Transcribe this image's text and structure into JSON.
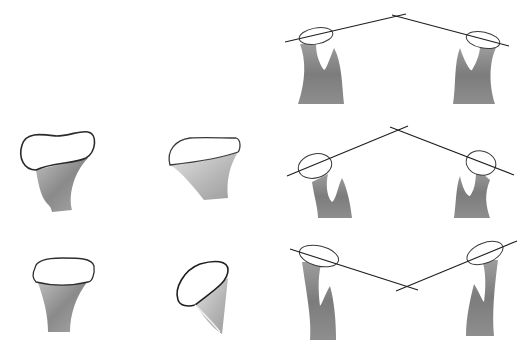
{
  "figure": {
    "background": "#ffffff",
    "colors": {
      "outline": "#2a2a2a",
      "shaft_dark": "#6e6e6e",
      "shaft_mid": "#9a9a9a",
      "shaft_light": "#c9c9c9",
      "head_fill": "#ffffff",
      "line": "#1e1e1e"
    },
    "left_views": [
      {
        "id": "row2-col1",
        "label": "",
        "row": 2,
        "col": 1
      },
      {
        "id": "row2-col2",
        "label": "",
        "row": 2,
        "col": 2
      },
      {
        "id": "row3-col1",
        "label": "",
        "row": 3,
        "col": 1
      },
      {
        "id": "row3-col2",
        "label": "",
        "row": 3,
        "col": 2
      }
    ],
    "section_pairs": [
      {
        "row": 1,
        "lines": [
          [
            285,
            42,
            406,
            14
          ],
          [
            392,
            15,
            509,
            46
          ]
        ],
        "intersection": [
          399,
          16
        ]
      },
      {
        "row": 2,
        "lines": [
          [
            287,
            176,
            408,
            126
          ],
          [
            390,
            127,
            514,
            175
          ]
        ],
        "intersection": [
          398,
          131
        ]
      },
      {
        "row": 3,
        "lines": [
          [
            290,
            249,
            418,
            290
          ],
          [
            396,
            291,
            517,
            241
          ]
        ],
        "intersection": [
          405,
          286
        ]
      }
    ]
  }
}
